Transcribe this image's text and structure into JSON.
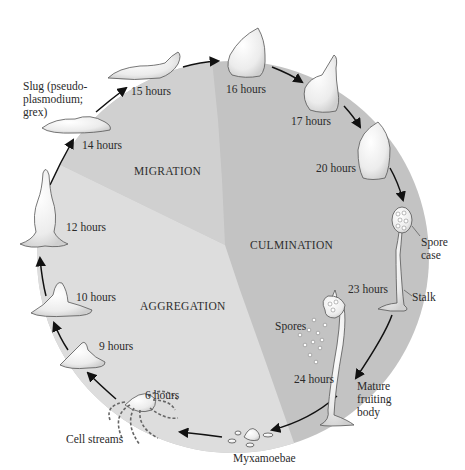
{
  "diagram": {
    "phases": [
      {
        "id": "migration",
        "label": "MIGRATION",
        "color": "#d0d0d0"
      },
      {
        "id": "culmination",
        "label": "CULMINATION",
        "color": "#c3c3c3"
      },
      {
        "id": "aggregation",
        "label": "AGGREGATION",
        "color": "#dddddd"
      }
    ],
    "stages": [
      {
        "time": "6 hours"
      },
      {
        "time": "9 hours"
      },
      {
        "time": "10 hours"
      },
      {
        "time": "12 hours"
      },
      {
        "time": "14 hours"
      },
      {
        "time": "15 hours"
      },
      {
        "time": "16 hours"
      },
      {
        "time": "17 hours"
      },
      {
        "time": "20 hours"
      },
      {
        "time": "23 hours"
      },
      {
        "time": "24 hours"
      }
    ],
    "annotations": {
      "slug": "Slug (pseudo-\nplasmodium;\ngrex)",
      "spore_case": "Spore\ncase",
      "stalk": "Stalk",
      "spores": "Spores",
      "mature_fruiting_body": "Mature\nfruiting\nbody",
      "myxamoebae": "Myxamoebae",
      "cell_streams": "Cell streams"
    },
    "colors": {
      "arrow": "#111111",
      "organism_fill": "#f2f2f2",
      "organism_stroke": "#555555"
    }
  }
}
